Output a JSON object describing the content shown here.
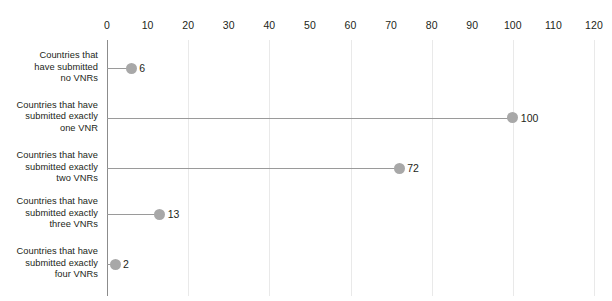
{
  "chart_data": {
    "type": "bar",
    "subtype": "lollipop-horizontal",
    "title": "",
    "subtitle": "",
    "xlabel": "",
    "ylabel": "",
    "xlim": [
      0,
      120
    ],
    "xticks": [
      0,
      10,
      20,
      30,
      40,
      50,
      60,
      70,
      80,
      90,
      100,
      110,
      120
    ],
    "xtick_labels": [
      "0",
      "10",
      "20",
      "30",
      "40",
      "50",
      "60",
      "70",
      "80",
      "90",
      "100",
      "110",
      "120"
    ],
    "xtick_label_position": "top",
    "gridlines": {
      "axis": "x",
      "at": [
        20,
        40,
        60,
        80,
        100,
        120
      ],
      "color": "#e9e9e9"
    },
    "legend": null,
    "categories": [
      "Countries that have submitted no VNRs",
      "Countries that have submitted exactly one VNR",
      "Countries that have submitted exactly two VNRs",
      "Countries that have submitted exactly three VNRs",
      "Countries that have submitted exactly four VNRs"
    ],
    "values": [
      6,
      100,
      72,
      13,
      2
    ],
    "data_labels": [
      "6",
      "100",
      "72",
      "13",
      "2"
    ],
    "colors": {
      "marker": "#a8a8a8",
      "stem": "#9a9a9a",
      "axis": "#8c8c8c",
      "text": "#231f20",
      "grid": "#e9e9e9",
      "background": "#ffffff"
    }
  },
  "rows": [
    {
      "label_lines": [
        "Countries that",
        "have submitted",
        "no VNRs"
      ],
      "value": 6,
      "value_label": "6"
    },
    {
      "label_lines": [
        "Countries that have",
        "submitted exactly",
        "one VNR"
      ],
      "value": 100,
      "value_label": "100"
    },
    {
      "label_lines": [
        "Countries that have",
        "submitted exactly",
        "two VNRs"
      ],
      "value": 72,
      "value_label": "72"
    },
    {
      "label_lines": [
        "Countries that have",
        "submitted exactly",
        "three VNRs"
      ],
      "value": 13,
      "value_label": "13"
    },
    {
      "label_lines": [
        "Countries that have",
        "submitted exactly",
        "four VNRs"
      ],
      "value": 2,
      "value_label": "2"
    }
  ]
}
